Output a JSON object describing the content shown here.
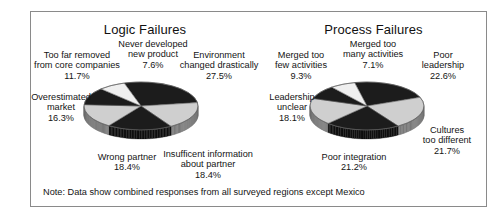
{
  "note": "Note: Data show combined responses from all surveyed regions except Mexico",
  "chart_data": [
    {
      "type": "pie",
      "title": "Logic Failures",
      "categories": [
        "Environment changed drastically",
        "Insufficent information about partner",
        "Wrong partner",
        "Overestimated market",
        "Too far removed from core companies",
        "Never developed new product"
      ],
      "values": [
        27.5,
        18.4,
        18.4,
        16.3,
        11.7,
        7.6
      ],
      "labels": [
        {
          "name": "Too far removed from core companies",
          "value": "11.7%",
          "lines": [
            "Too far removed",
            "from core companies",
            "11.7%"
          ]
        },
        {
          "name": "Never developed new product",
          "value": "7.6%",
          "lines": [
            "Never developed",
            "new product",
            "7.6%"
          ]
        },
        {
          "name": "Environment changed drastically",
          "value": "27.5%",
          "lines": [
            "Environment",
            "changed drastically",
            "27.5%"
          ]
        },
        {
          "name": "Overestimated market",
          "value": "16.3%",
          "lines": [
            "Overestimated",
            "market",
            "16.3%"
          ]
        },
        {
          "name": "Wrong partner",
          "value": "18.4%",
          "lines": [
            "Wrong partner",
            "18.4%"
          ]
        },
        {
          "name": "Insufficent information about partner",
          "value": "18.4%",
          "lines": [
            "Insufficent information",
            "about partner",
            "18.4%"
          ]
        }
      ],
      "colors": [
        "#1c1c1c",
        "#cfcfcf",
        "#1c1c1c",
        "#cfcfcf",
        "#1c1c1c",
        "#efefef"
      ]
    },
    {
      "type": "pie",
      "title": "Process Failures",
      "categories": [
        "Poor leadership",
        "Cultures too different",
        "Poor integration",
        "Leadership unclear",
        "Merged too few activities",
        "Merged too many activities"
      ],
      "values": [
        22.6,
        21.7,
        21.2,
        18.1,
        9.3,
        7.1
      ],
      "labels": [
        {
          "name": "Merged too few activities",
          "value": "9.3%",
          "lines": [
            "Merged too",
            "few activities",
            "9.3%"
          ]
        },
        {
          "name": "Merged too many activities",
          "value": "7.1%",
          "lines": [
            "Merged too",
            "many activities",
            "7.1%"
          ]
        },
        {
          "name": "Poor leadership",
          "value": "22.6%",
          "lines": [
            "Poor",
            "leadership",
            "22.6%"
          ]
        },
        {
          "name": "Leadership unclear",
          "value": "18.1%",
          "lines": [
            "Leadership",
            "unclear",
            "18.1%"
          ]
        },
        {
          "name": "Poor integration",
          "value": "21.2%",
          "lines": [
            "Poor integration",
            "21.2%"
          ]
        },
        {
          "name": "Cultures too different",
          "value": "21.7%",
          "lines": [
            "Cultures",
            "too different",
            "21.7%"
          ]
        }
      ],
      "colors": [
        "#1c1c1c",
        "#cfcfcf",
        "#1c1c1c",
        "#cfcfcf",
        "#1c1c1c",
        "#efefef"
      ]
    }
  ]
}
